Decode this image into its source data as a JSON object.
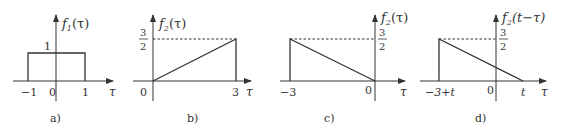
{
  "figure": {
    "panels": [
      {
        "id": "a",
        "caption": "a)",
        "ylabel_f": "f",
        "ylabel_sub": "1",
        "ylabel_arg": "(τ)",
        "xlabel": "τ",
        "height_label": "1",
        "ticks": [
          "−1",
          "0",
          "1"
        ],
        "description": "Rectangular pulse of height 1 from τ=−1 to τ=1"
      },
      {
        "id": "b",
        "caption": "b)",
        "ylabel_f": "f",
        "ylabel_sub": "2",
        "ylabel_arg": "(τ)",
        "xlabel": "τ",
        "height_num": "3",
        "height_den": "2",
        "ticks": [
          "0",
          "3"
        ],
        "description": "Ramp from (0,0) to (3,3/2), then drops to 0"
      },
      {
        "id": "c",
        "caption": "c)",
        "ylabel_f": "f",
        "ylabel_sub": "2",
        "ylabel_arg": "(τ)",
        "xlabel": "τ",
        "height_num": "3",
        "height_den": "2",
        "ticks": [
          "−3",
          "0"
        ],
        "description": "Reflected ramp: jump to 3/2 at τ=−3 decreasing linearly to 0 at τ=0"
      },
      {
        "id": "d",
        "caption": "d)",
        "ylabel_f": "f",
        "ylabel_sub": "2",
        "ylabel_arg": "(t−τ)",
        "xlabel": "τ",
        "height_num": "3",
        "height_den": "2",
        "ticks": [
          "−3+t",
          "0",
          "t"
        ],
        "description": "Shifted reflected ramp: jump to 3/2 at τ=−3+t decreasing linearly to 0 at τ=t"
      }
    ],
    "stroke_color": "#333333",
    "background": "#ffffff"
  }
}
